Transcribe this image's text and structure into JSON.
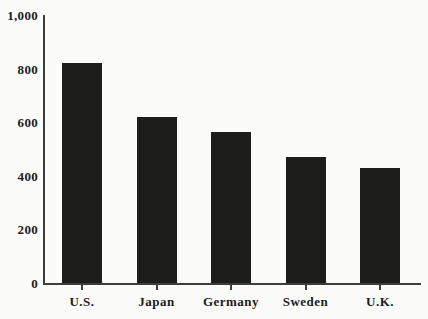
{
  "chart_data": {
    "type": "bar",
    "title": "",
    "xlabel": "",
    "ylabel": "",
    "categories": [
      "U.S.",
      "Japan",
      "Germany",
      "Sweden",
      "U.K."
    ],
    "values": [
      820,
      620,
      565,
      470,
      430
    ],
    "ylim": [
      0,
      1000
    ],
    "yticks": [
      {
        "value": 0,
        "label": "0"
      },
      {
        "value": 200,
        "label": "200"
      },
      {
        "value": 400,
        "label": "400"
      },
      {
        "value": 600,
        "label": "600"
      },
      {
        "value": 800,
        "label": "800"
      },
      {
        "value": 1000,
        "label": "1,000"
      }
    ],
    "grid": false,
    "legend": false,
    "bar_color": "#1d1d1c",
    "axis_color": "#3d3d3d",
    "background_color": "#fbfbfa"
  }
}
